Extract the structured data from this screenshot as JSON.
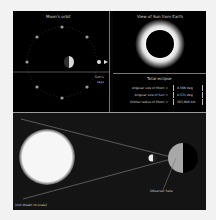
{
  "orbit_panel": {
    "title": "Moon's orbit",
    "sun_rays_label_line1": "Sun's",
    "sun_rays_label_line2": "rays"
  },
  "view_panel": {
    "title": "View of Sun from Earth"
  },
  "info_panel": {
    "title": "Total eclipse",
    "rows": [
      {
        "label": "Angular size of Moon =",
        "value": "0.566",
        "unit": "deg"
      },
      {
        "label": "Angular size of Sun =",
        "value": "0.531",
        "unit": "deg"
      },
      {
        "label": "Orbital radius of Moon =",
        "value": "363,600",
        "unit": "km"
      }
    ]
  },
  "scene_panel": {
    "observer_label": "Observer here",
    "scale_note": "(not drawn to scale)"
  },
  "colors": {
    "background": "#000000",
    "sun": "#f4f4f4",
    "earth_lit": "#a8a8a8",
    "text": "#d8d8d8"
  }
}
